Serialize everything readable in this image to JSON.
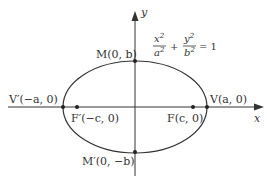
{
  "diagram": {
    "type": "ellipse-with-foci",
    "equation": {
      "term1_num": "x",
      "term1_num_exp": "2",
      "term1_den": "a",
      "term1_den_exp": "2",
      "plus": "+",
      "term2_num": "y",
      "term2_num_exp": "2",
      "term2_den": "b",
      "term2_den_exp": "2",
      "equals": "= 1"
    },
    "axes": {
      "x_label": "x",
      "y_label": "y"
    },
    "points": {
      "vertex_right": "V(a, 0)",
      "vertex_left": "V′(−a, 0)",
      "focus_right": "F(c, 0)",
      "focus_left": "F′(−c, 0)",
      "minor_top": "M(0, b)",
      "minor_bottom": "M′(0, −b)"
    },
    "colors": {
      "stroke": "#333333",
      "background": "#ffffff"
    }
  }
}
